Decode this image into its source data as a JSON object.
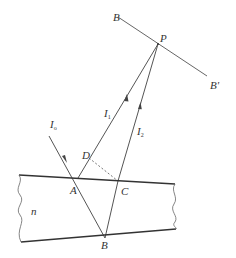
{
  "diagram": {
    "type": "thin-film interference geometry",
    "colors": {
      "line": "#555555",
      "surface": "#333333",
      "background": "#ffffff"
    },
    "labels": {
      "screen_left": "B",
      "screen_right": "B'",
      "point_P": "P",
      "ray_I1": "I",
      "ray_I1_sub": "1",
      "ray_I2": "I",
      "ray_I2_sub": "2",
      "ray_I0": "I",
      "ray_I0_sub": "o",
      "point_D": "D",
      "point_A": "A",
      "point_C": "C",
      "point_B": "B",
      "medium_n": "n"
    }
  }
}
